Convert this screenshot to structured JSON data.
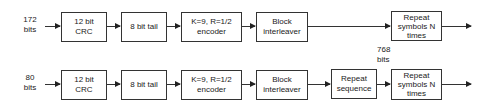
{
  "diagram": {
    "rows": [
      {
        "input_label": [
          "172",
          "bits"
        ],
        "blocks": [
          {
            "id": "crc",
            "lines": [
              "12 bit",
              "CRC"
            ]
          },
          {
            "id": "tail",
            "lines": [
              "8 bit tail"
            ]
          },
          {
            "id": "encoder",
            "lines": [
              "K=9, R=1/2",
              "encoder"
            ]
          },
          {
            "id": "interleaver",
            "lines": [
              "Block",
              "interleaver"
            ]
          },
          {
            "id": "repeat-symbols",
            "lines": [
              "Repeat",
              "symbols N",
              "times"
            ]
          }
        ]
      },
      {
        "input_label": [
          "80",
          "bits"
        ],
        "blocks": [
          {
            "id": "crc",
            "lines": [
              "12 bit",
              "CRC"
            ]
          },
          {
            "id": "tail",
            "lines": [
              "8 bit tail"
            ]
          },
          {
            "id": "encoder",
            "lines": [
              "K=9, R=1/2",
              "encoder"
            ]
          },
          {
            "id": "interleaver",
            "lines": [
              "Block",
              "interleaver"
            ]
          },
          {
            "id": "repeat-sequence",
            "lines": [
              "Repeat",
              "sequence"
            ]
          },
          {
            "id": "repeat-symbols",
            "lines": [
              "Repeat",
              "symbols N",
              "times"
            ]
          }
        ]
      }
    ],
    "intermediate_label": [
      "768",
      "bits"
    ]
  }
}
